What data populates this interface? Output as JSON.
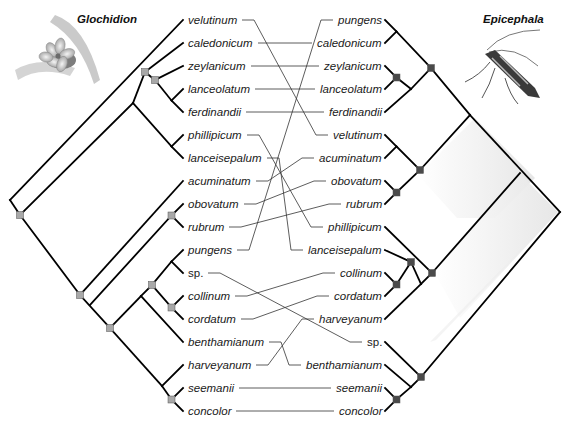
{
  "figure": {
    "type": "cophylogeny tanglegram",
    "left_title": "Glochidion",
    "right_title": "Epicephala",
    "left_illustration": "flower-illustration",
    "right_illustration": "moth-illustration",
    "colors": {
      "branch": "#000000",
      "link": "#333333",
      "node_left": "#a8a8a8",
      "node_right": "#4a4a4a",
      "shade": "#e8e8e8"
    }
  },
  "left_taxa": [
    {
      "name": "velutinum",
      "y": 20
    },
    {
      "name": "caledonicum",
      "y": 43
    },
    {
      "name": "zeylanicum",
      "y": 66
    },
    {
      "name": "lanceolatum",
      "y": 89
    },
    {
      "name": "ferdinandii",
      "y": 112
    },
    {
      "name": "phillipicum",
      "y": 135
    },
    {
      "name": "lanceisepalum",
      "y": 158
    },
    {
      "name": "acuminatum",
      "y": 181
    },
    {
      "name": "obovatum",
      "y": 204
    },
    {
      "name": "rubrum",
      "y": 227
    },
    {
      "name": "pungens",
      "y": 250
    },
    {
      "name": "sp.",
      "y": 273,
      "plain": true
    },
    {
      "name": "collinum",
      "y": 296
    },
    {
      "name": "cordatum",
      "y": 319
    },
    {
      "name": "benthamianum",
      "y": 342
    },
    {
      "name": "harveyanum",
      "y": 365
    },
    {
      "name": "seemanii",
      "y": 388
    },
    {
      "name": "concolor",
      "y": 411
    }
  ],
  "right_taxa": [
    {
      "name": "pungens",
      "y": 20
    },
    {
      "name": "caledonicum",
      "y": 43
    },
    {
      "name": "zeylanicum",
      "y": 66
    },
    {
      "name": "lanceolatum",
      "y": 89
    },
    {
      "name": "ferdinandii",
      "y": 112
    },
    {
      "name": "velutinum",
      "y": 135
    },
    {
      "name": "acuminatum",
      "y": 158
    },
    {
      "name": "obovatum",
      "y": 181
    },
    {
      "name": "rubrum",
      "y": 204
    },
    {
      "name": "phillipicum",
      "y": 227
    },
    {
      "name": "lanceisepalum",
      "y": 250
    },
    {
      "name": "collinum",
      "y": 273
    },
    {
      "name": "cordatum",
      "y": 296
    },
    {
      "name": "harveyanum",
      "y": 319
    },
    {
      "name": "sp.",
      "y": 342,
      "plain": true
    },
    {
      "name": "benthamianum",
      "y": 365
    },
    {
      "name": "seemanii",
      "y": 388
    },
    {
      "name": "concolor",
      "y": 411
    }
  ],
  "associations": [
    [
      "velutinum",
      "velutinum"
    ],
    [
      "caledonicum",
      "caledonicum"
    ],
    [
      "zeylanicum",
      "zeylanicum"
    ],
    [
      "lanceolatum",
      "lanceolatum"
    ],
    [
      "ferdinandii",
      "ferdinandii"
    ],
    [
      "phillipicum",
      "phillipicum"
    ],
    [
      "lanceisepalum",
      "lanceisepalum"
    ],
    [
      "acuminatum",
      "acuminatum"
    ],
    [
      "obovatum",
      "obovatum"
    ],
    [
      "rubrum",
      "rubrum"
    ],
    [
      "pungens",
      "pungens"
    ],
    [
      "sp.",
      "sp."
    ],
    [
      "collinum",
      "collinum"
    ],
    [
      "cordatum",
      "cordatum"
    ],
    [
      "benthamianum",
      "benthamianum"
    ],
    [
      "harveyanum",
      "harveyanum"
    ],
    [
      "seemanii",
      "seemanii"
    ],
    [
      "concolor",
      "concolor"
    ]
  ]
}
